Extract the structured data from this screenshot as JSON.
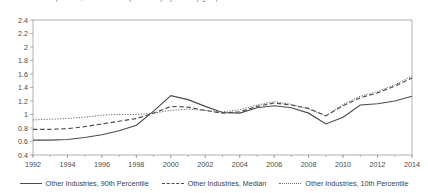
{
  "figure": {
    "title_clipped": "2. Debt/EBITDA (median, 10th and 90th percentile), by industry group",
    "title_visible": false
  },
  "legend": {
    "position": "bottom-center",
    "items": [
      {
        "label": "Other Industries, 90th Percentile",
        "style": "solid",
        "swatch": "line-solid-swatch"
      },
      {
        "label": "Other Industries, Median",
        "style": "dashed",
        "swatch": "line-dashed-swatch"
      },
      {
        "label": "Other Industries, 10th Percentile",
        "style": "dotted",
        "swatch": "line-dotted-swatch"
      }
    ]
  },
  "axes": {
    "y_ticks": [
      "2.4",
      "2.2",
      "2",
      "1.8",
      "1.6",
      "1.4",
      "1.2",
      "1",
      "0.8",
      "0.6",
      "0.4"
    ],
    "x_ticks": [
      "1992",
      "1994",
      "1996",
      "1998",
      "2000",
      "2002",
      "2004",
      "2006",
      "2008",
      "2010",
      "2012",
      "2014"
    ]
  },
  "chart_data": {
    "type": "line",
    "title": "",
    "xlabel": "",
    "ylabel": "",
    "xlim": [
      1992,
      2014
    ],
    "ylim": [
      0.4,
      2.4
    ],
    "y_tick_step": 0.2,
    "x_tick_step": 2,
    "grid": false,
    "legend_position": "bottom-center",
    "x": [
      1992,
      1993,
      1994,
      1995,
      1996,
      1997,
      1998,
      1999,
      2000,
      2001,
      2002,
      2003,
      2004,
      2005,
      2006,
      2007,
      2008,
      2009,
      2010,
      2011,
      2012,
      2013,
      2014
    ],
    "series": [
      {
        "name": "Other Industries, 90th Percentile",
        "style": "solid",
        "values": [
          0.62,
          0.62,
          0.63,
          0.66,
          0.7,
          0.76,
          0.84,
          1.05,
          1.28,
          1.22,
          1.12,
          1.03,
          1.02,
          1.1,
          1.13,
          1.1,
          1.02,
          0.86,
          0.96,
          1.14,
          1.16,
          1.2,
          1.27
        ]
      },
      {
        "name": "Other Industries, Median",
        "style": "dashed",
        "values": [
          0.78,
          0.78,
          0.79,
          0.82,
          0.86,
          0.9,
          0.94,
          1.02,
          1.12,
          1.11,
          1.06,
          1.02,
          1.04,
          1.12,
          1.17,
          1.14,
          1.09,
          0.98,
          1.13,
          1.25,
          1.32,
          1.42,
          1.54
        ]
      },
      {
        "name": "Other Industries, 10th Percentile",
        "style": "dotted",
        "values": [
          0.92,
          0.93,
          0.94,
          0.96,
          0.99,
          1.0,
          1.0,
          1.02,
          1.06,
          1.08,
          1.06,
          1.04,
          1.07,
          1.14,
          1.19,
          1.15,
          1.08,
          0.98,
          1.15,
          1.27,
          1.34,
          1.44,
          1.57
        ]
      }
    ]
  }
}
